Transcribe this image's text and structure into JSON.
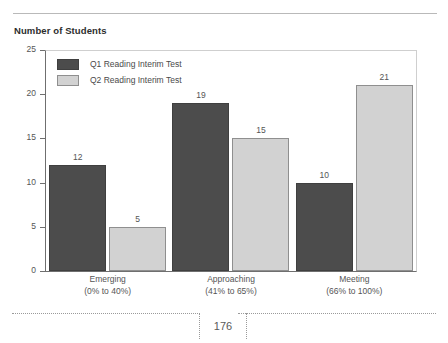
{
  "page": {
    "title": "Number of Students",
    "page_number": "176"
  },
  "chart_data": {
    "type": "bar",
    "title": "Number of Students",
    "xlabel": "",
    "ylabel": "Number of Students",
    "ylim": [
      0,
      25
    ],
    "yticks": [
      0,
      5,
      10,
      15,
      20,
      25
    ],
    "ytick_labels": [
      "0",
      "5",
      "10",
      "15",
      "20",
      "25"
    ],
    "grid": false,
    "legend_position": "top-left inside plot",
    "categories": [
      "Emerging",
      "Approaching",
      "Meeting"
    ],
    "category_ranges": [
      "(0% to 40%)",
      "(41% to 65%)",
      "(66% to 100%)"
    ],
    "series": [
      {
        "name": "Q1 Reading Interim Test",
        "color": "#4c4c4c",
        "values": [
          12,
          19,
          10
        ],
        "value_labels": [
          "12",
          "19",
          "10"
        ]
      },
      {
        "name": "Q2 Reading Interim Test",
        "color": "#d2d2d2",
        "values": [
          5,
          15,
          21
        ],
        "value_labels": [
          "5",
          "15",
          "21"
        ]
      }
    ]
  }
}
